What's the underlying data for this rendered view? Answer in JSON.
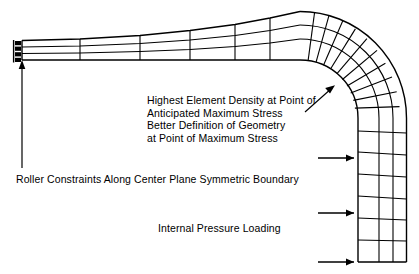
{
  "figure": {
    "background_color": "#ffffff",
    "line_color": "#000000",
    "width": 419,
    "height": 274
  },
  "annotations": {
    "element_density": {
      "lines": [
        "Highest Element Density at Point of",
        "Anticipated Maximum Stress",
        "Better Definition of Geometry",
        "at Point of Maximum Stress"
      ],
      "text": "Highest Element Density at Point of\nAnticipated Maximum Stress\nBetter Definition of Geometry\nat Point of Maximum Stress"
    },
    "roller_constraints": {
      "text": "Roller Constraints Along Center Plane Symmetric Boundary"
    },
    "internal_pressure": {
      "text": "Internal Pressure Loading"
    }
  },
  "mesh": {
    "description": "90 degree pipe elbow finite element mesh, three elements through wall thickness",
    "layers_through_thickness": 3,
    "horizontal_leg": {
      "columns": 7,
      "rows": 3,
      "x_start": 22,
      "x_end": 300,
      "taper": "outer surface slopes upward toward the bend"
    },
    "bend": {
      "radial_divisions": 11,
      "rows": 3,
      "sweep_degrees": 90,
      "center_x": 300,
      "center_y": 118,
      "inner_radius": 42,
      "outer_radius": 104
    },
    "vertical_leg": {
      "columns": 3,
      "rows": 7,
      "y_start": 118,
      "y_end": 262,
      "x_inner": 342,
      "x_outer": 404
    }
  },
  "markers": {
    "roller_constraint": {
      "icon": "roller-constraint-icon",
      "count": 4,
      "edge": "left end of horizontal leg"
    },
    "pressure_arrow": {
      "icon": "arrow-right-icon",
      "count": 3,
      "direction": "right",
      "edge": "inner surface of vertical leg"
    },
    "leader_roller": {
      "icon": "arrow-up-icon",
      "direction": "up"
    },
    "leader_density": {
      "icon": "arrow-up-right-icon",
      "direction": "up-right"
    }
  }
}
